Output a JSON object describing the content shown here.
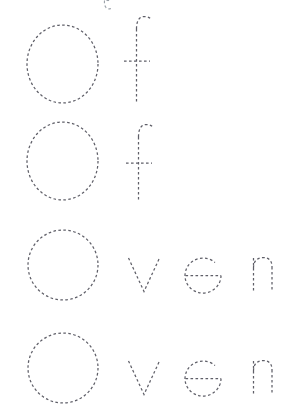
{
  "worksheet": {
    "title": "Of / Oven tracing practice",
    "background_color": "#ffffff",
    "stroke_color": "#5f5f68",
    "faint_stroke_color": "#9aa0a8",
    "dash_pattern": "2.6 2.4",
    "stroke_width": 1.25,
    "canvas": {
      "width": 300,
      "height": 417
    },
    "rows": [
      {
        "id": "row-1",
        "word": "Of",
        "baseline_y": 103,
        "clipped": false,
        "letters": [
          {
            "char": "O",
            "case": "upper",
            "x": 27,
            "y": 25,
            "width": 71,
            "height": 78
          },
          {
            "char": "f",
            "case": "lower",
            "x": 128,
            "y": 16,
            "width": 24,
            "height": 87
          }
        ]
      },
      {
        "id": "row-2",
        "word": "Of",
        "baseline_y": 200,
        "clipped": false,
        "letters": [
          {
            "char": "O",
            "case": "upper",
            "x": 27,
            "y": 122,
            "width": 71,
            "height": 78
          },
          {
            "char": "f",
            "case": "lower",
            "x": 130,
            "y": 124,
            "width": 24,
            "height": 78
          }
        ]
      },
      {
        "id": "row-3",
        "word": "Oven",
        "baseline_y": 300,
        "clipped": false,
        "letters": [
          {
            "char": "O",
            "case": "upper",
            "x": 28,
            "y": 230,
            "width": 70,
            "height": 70
          },
          {
            "char": "v",
            "case": "lower",
            "x": 128,
            "y": 258,
            "width": 32,
            "height": 34
          },
          {
            "char": "e",
            "case": "lower",
            "x": 185,
            "y": 258,
            "width": 36,
            "height": 34
          },
          {
            "char": "n",
            "case": "lower",
            "x": 253,
            "y": 258,
            "width": 33,
            "height": 34
          }
        ]
      },
      {
        "id": "row-4",
        "word": "Oven",
        "baseline_y": 403,
        "clipped": true,
        "letters": [
          {
            "char": "O",
            "case": "upper",
            "x": 28,
            "y": 333,
            "width": 70,
            "height": 70
          },
          {
            "char": "v",
            "case": "lower",
            "x": 128,
            "y": 361,
            "width": 32,
            "height": 34
          },
          {
            "char": "e",
            "case": "lower",
            "x": 185,
            "y": 361,
            "width": 36,
            "height": 34
          },
          {
            "char": "n",
            "case": "lower",
            "x": 253,
            "y": 361,
            "width": 33,
            "height": 34
          }
        ]
      }
    ],
    "artifacts": [
      {
        "id": "top-fragment",
        "description": "faint clipped glyph fragment at top edge",
        "x": 103,
        "y": 0,
        "width": 10,
        "height": 9
      }
    ]
  }
}
